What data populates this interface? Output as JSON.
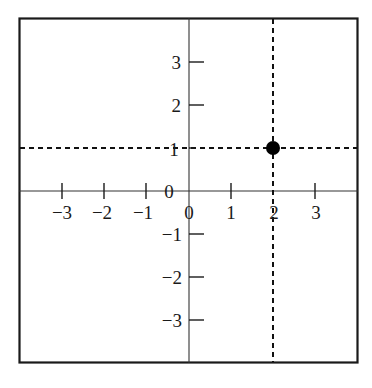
{
  "diagram": {
    "type": "coordinate-plane",
    "frame": {
      "x": 19,
      "y": 18,
      "width": 339,
      "height": 345,
      "stroke": "#1a1a1a"
    },
    "origin_px": {
      "x": 189,
      "y": 191
    },
    "unit_px": 42.3,
    "x_axis": {
      "ticks": [
        -3,
        -2,
        -1,
        1,
        2,
        3
      ],
      "labels": [
        "−3",
        "−2",
        "−1",
        "0",
        "1",
        "2",
        "3"
      ]
    },
    "y_axis": {
      "ticks": [
        3,
        2,
        1,
        -1,
        -2,
        -3
      ],
      "labels": [
        "3",
        "2",
        "1",
        "0",
        "−1",
        "−2",
        "−3"
      ]
    },
    "point": {
      "x": 2,
      "y": 1,
      "color": "#000000"
    },
    "guides": [
      {
        "orientation": "horizontal",
        "value": 1,
        "style": "dashed"
      },
      {
        "orientation": "vertical",
        "value": 2,
        "style": "dashed"
      }
    ]
  },
  "labels": {
    "x_m3": "−3",
    "x_m2": "−2",
    "x_m1": "−1",
    "x_0": "0",
    "x_1": "1",
    "x_2": "2",
    "x_3": "3",
    "y_3": "3",
    "y_2": "2",
    "y_1": "1",
    "y_0": "0",
    "y_m1": "−1",
    "y_m2": "−2",
    "y_m3": "−3"
  }
}
